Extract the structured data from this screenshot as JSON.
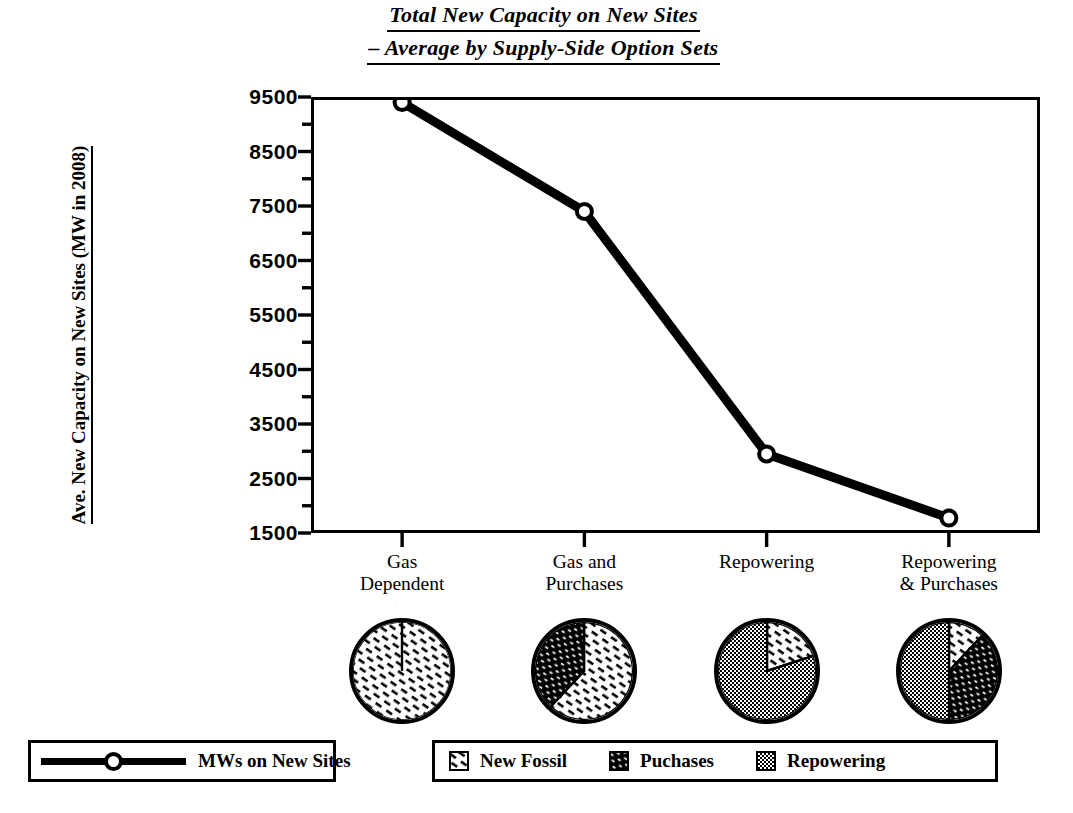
{
  "title": {
    "line1": "Total New Capacity on New Sites",
    "line2": "– Average by Supply-Side Option Sets"
  },
  "axes": {
    "y_title": "Ave. New Capacity on New Sites (MW in 2008)",
    "y_ticks": [
      "9500",
      "8500",
      "7500",
      "6500",
      "5500",
      "4500",
      "3500",
      "2500",
      "1500"
    ]
  },
  "legend_line": {
    "label": "MWs on New Sites",
    "marker": "open-circle",
    "color": "#000000"
  },
  "legend_pie": {
    "items": [
      {
        "label": "New Fossil",
        "pattern": "light-dash-hatch",
        "color": "#ffffff"
      },
      {
        "label": "Puchases",
        "pattern": "dark-diagonal-hatch",
        "color": "#000000"
      },
      {
        "label": "Repowering",
        "pattern": "gray-dot-checker",
        "color": "#808080"
      }
    ]
  },
  "pies": [
    {
      "name": "gas-dependent-pie",
      "slices": [
        {
          "series": "New Fossil",
          "pct": 100
        }
      ]
    },
    {
      "name": "gas-and-purchases-pie",
      "slices": [
        {
          "series": "New Fossil",
          "pct": 62
        },
        {
          "series": "Puchases",
          "pct": 38
        }
      ]
    },
    {
      "name": "repowering-pie",
      "slices": [
        {
          "series": "New Fossil",
          "pct": 20
        },
        {
          "series": "Repowering",
          "pct": 80
        }
      ]
    },
    {
      "name": "repowering-and-purchases-pie",
      "slices": [
        {
          "series": "New Fossil",
          "pct": 12
        },
        {
          "series": "Puchases",
          "pct": 38
        },
        {
          "series": "Repowering",
          "pct": 50
        }
      ]
    }
  ],
  "chart_data": {
    "type": "line",
    "title": "Total New Capacity on New Sites – Average by Supply-Side Option Sets",
    "xlabel": "",
    "ylabel": "Ave. New Capacity on New Sites (MW in 2008)",
    "categories": [
      "Gas Dependent",
      "Gas and Purchases",
      "Repowering",
      "Repowering & Purchases"
    ],
    "category_lines": [
      [
        "Gas",
        "Dependent"
      ],
      [
        "Gas and",
        "Purchases"
      ],
      [
        "Repowering",
        ""
      ],
      [
        "Repowering",
        "& Purchases"
      ]
    ],
    "series": [
      {
        "name": "MWs on New Sites",
        "values": [
          9400,
          7400,
          2950,
          1775
        ]
      }
    ],
    "ylim": [
      1500,
      9500
    ],
    "ytick_step": 1000,
    "minor_ticks": true,
    "grid": false,
    "legend_position": "bottom-left",
    "marker": "open-circle",
    "line_width_px": 9,
    "pie_inset": {
      "type": "pie",
      "legend_position": "bottom-right",
      "categories": [
        "New Fossil",
        "Puchases",
        "Repowering"
      ],
      "groups": [
        {
          "name": "Gas Dependent",
          "values": [
            100,
            0,
            0
          ]
        },
        {
          "name": "Gas and Purchases",
          "values": [
            62,
            38,
            0
          ]
        },
        {
          "name": "Repowering",
          "values": [
            20,
            0,
            80
          ]
        },
        {
          "name": "Repowering & Purchases",
          "values": [
            12,
            38,
            50
          ]
        }
      ]
    }
  }
}
